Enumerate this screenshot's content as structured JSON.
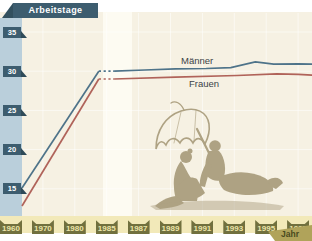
{
  "y_axis": {
    "title": "Arbeitstage",
    "ticks": [
      "35",
      "30",
      "25",
      "20",
      "15"
    ],
    "tick_values": [
      35,
      30,
      25,
      20,
      15
    ]
  },
  "x_axis": {
    "title": "Jahr",
    "ticks": [
      "1960",
      "1970",
      "1980",
      "1985",
      "1987",
      "1989",
      "1991",
      "1993",
      "1995",
      "1997"
    ]
  },
  "series_labels": {
    "maenner": "Männer",
    "frauen": "Frauen"
  },
  "illustration": "couple-relaxing-under-beach-umbrella",
  "colors": {
    "maenner_line": "#4e7389",
    "frauen_line": "#b0635a",
    "banner": "#3d5d6f",
    "y_strip": "#bacfdb",
    "x_strip": "#f2e9b9",
    "x_tag": "#71703e",
    "x_tag_text": "#ece5a9",
    "jahr_tag": "#b0a35a",
    "plot_bg": "#f6f1e3",
    "gap_band": "#fdfbf2",
    "illustration_color": "#aea283",
    "gridline": "#ffffff"
  },
  "chart_data": {
    "type": "line",
    "title": "",
    "xlabel": "Jahr",
    "ylabel": "Arbeitstage",
    "categories": [
      "1960",
      "1970",
      "1980",
      "1985",
      "1987",
      "1989",
      "1991",
      "1993",
      "1995",
      "1997"
    ],
    "series": [
      {
        "name": "Männer",
        "values": [
          15.1,
          21.1,
          27.0,
          30.0,
          30.15,
          30.3,
          30.35,
          30.6,
          31.1,
          30.95
        ]
      },
      {
        "name": "Frauen",
        "values": [
          12.8,
          19.3,
          25.8,
          29.0,
          29.1,
          29.25,
          29.35,
          29.45,
          29.6,
          29.6
        ]
      }
    ],
    "ylim": [
      12,
      37
    ],
    "grid": "subtle white gridlines on cream background",
    "legend_position": "inline labels above/below right line ends",
    "annotations": [
      "Liniensegment zwischen 1980 und 1985 gepunktet (Datenlücke, heller Streifen im Hintergrund)"
    ],
    "draw_anchors": {
      "comment": "x = category index (0=1960 ... 9=1997, plot edge = 9.45); dotted between index 2.5 and 3",
      "dotted_range": [
        2.5,
        3.0
      ],
      "maenner": [
        [
          0,
          15.1
        ],
        [
          2.5,
          30.0
        ],
        [
          3,
          30.0
        ],
        [
          4,
          30.15
        ],
        [
          5,
          30.3
        ],
        [
          6,
          30.35
        ],
        [
          6.8,
          30.45
        ],
        [
          7.6,
          31.2
        ],
        [
          8.2,
          30.9
        ],
        [
          9,
          30.95
        ],
        [
          9.45,
          30.9
        ]
      ],
      "frauen": [
        [
          0,
          12.8
        ],
        [
          2.5,
          29.0
        ],
        [
          3,
          29.0
        ],
        [
          5,
          29.25
        ],
        [
          7,
          29.45
        ],
        [
          8.3,
          29.65
        ],
        [
          9,
          29.6
        ],
        [
          9.45,
          29.5
        ]
      ]
    }
  }
}
